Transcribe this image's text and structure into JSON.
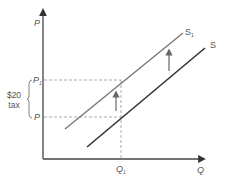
{
  "diagram": {
    "type": "supply-shift-tax",
    "axes": {
      "y_label": "P",
      "x_label": "Q"
    },
    "price_levels": {
      "p1_label": "P",
      "p1_sub": "1",
      "p_label": "P"
    },
    "quantity_levels": {
      "q1_label": "Q",
      "q1_sub": "1"
    },
    "curves": [
      {
        "name": "S",
        "label": "S",
        "sub": "",
        "color": "#333333"
      },
      {
        "name": "S1",
        "label": "S",
        "sub": "1",
        "color": "#777777"
      }
    ],
    "tax_annotation": {
      "line1": "$20",
      "line2": "tax"
    },
    "colors": {
      "axis": "#444444",
      "dashed": "#aaaaaa",
      "arrow": "#666666",
      "text": "#555555"
    }
  }
}
